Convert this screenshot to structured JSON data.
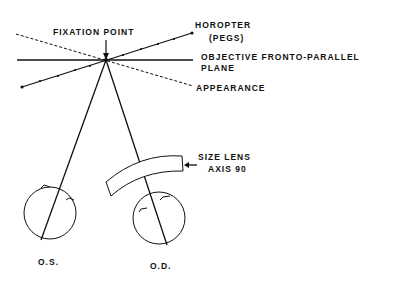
{
  "diagram": {
    "labels": {
      "fixation_point": "FIXATION POINT",
      "horopter": "HOROPTER",
      "horopter_sub": "(PEGS)",
      "objective_plane": "OBJECTIVE FRONTO-PARALLEL",
      "objective_plane_sub": "PLANE",
      "appearance": "APPEARANCE",
      "size_lens": "SIZE LENS",
      "size_lens_sub": "AXIS 90",
      "left_eye": "O.S.",
      "right_eye": "O.D."
    }
  }
}
